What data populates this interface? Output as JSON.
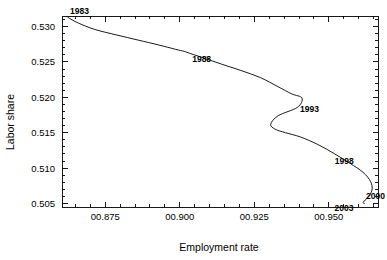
{
  "chart_data": {
    "type": "line",
    "title": "",
    "xlabel": "Employment rate",
    "ylabel": "Labor share",
    "xlim": [
      0.8605,
      0.9665
    ],
    "ylim": [
      0.5045,
      0.5315
    ],
    "grid": false,
    "legend": "none",
    "x_ticks": [
      {
        "value": 0.875,
        "label": "00.875"
      },
      {
        "value": 0.9,
        "label": "00.900"
      },
      {
        "value": 0.925,
        "label": "00.925"
      },
      {
        "value": 0.95,
        "label": "00.950"
      }
    ],
    "y_ticks": [
      {
        "value": 0.505,
        "label": "0.505"
      },
      {
        "value": 0.51,
        "label": "0.510"
      },
      {
        "value": 0.515,
        "label": "0.515"
      },
      {
        "value": 0.52,
        "label": "0.520"
      },
      {
        "value": 0.525,
        "label": "0.525"
      },
      {
        "value": 0.53,
        "label": "0.530"
      }
    ],
    "x_minor_step": 0.005,
    "y_minor_step": 0.001,
    "series": [
      {
        "name": "Employment rate vs Labor share",
        "x": [
          0.8625,
          0.866,
          0.8715,
          0.879,
          0.886,
          0.893,
          0.8985,
          0.9015,
          0.9035,
          0.9085,
          0.914,
          0.9205,
          0.927,
          0.933,
          0.9375,
          0.941,
          0.9395,
          0.933,
          0.9305,
          0.932,
          0.9355,
          0.9405,
          0.9465,
          0.952,
          0.957,
          0.9615,
          0.964,
          0.9645,
          0.963,
          0.9615,
          0.962
        ],
        "y": [
          0.5313,
          0.5305,
          0.5296,
          0.5288,
          0.5281,
          0.5274,
          0.5268,
          0.5265,
          0.5262,
          0.5255,
          0.5247,
          0.5238,
          0.5228,
          0.5215,
          0.5205,
          0.5199,
          0.5186,
          0.5174,
          0.5162,
          0.5155,
          0.515,
          0.5144,
          0.5133,
          0.512,
          0.5107,
          0.5094,
          0.5081,
          0.5069,
          0.5058,
          0.5052,
          0.505
        ]
      }
    ],
    "annotations": [
      {
        "text": "1983",
        "x": 0.8625,
        "y": 0.5313,
        "dx": 2,
        "dy": -3,
        "anchor": "start"
      },
      {
        "text": "1988",
        "x": 0.9035,
        "y": 0.5262,
        "dx": 2,
        "dy": 9,
        "anchor": "start"
      },
      {
        "text": "1993",
        "x": 0.941,
        "y": 0.5199,
        "dx": -2,
        "dy": 14,
        "anchor": "start"
      },
      {
        "text": "1998",
        "x": 0.952,
        "y": 0.512,
        "dx": 0,
        "dy": 10,
        "anchor": "start"
      },
      {
        "text": "2000",
        "x": 0.9645,
        "y": 0.5069,
        "dx": -6,
        "dy": 9,
        "anchor": "start"
      },
      {
        "text": "2003",
        "x": 0.962,
        "y": 0.505,
        "dx": -30,
        "dy": 8,
        "anchor": "start"
      }
    ]
  },
  "axes": {
    "x_title": "Employment rate",
    "y_title": "Labor share"
  }
}
